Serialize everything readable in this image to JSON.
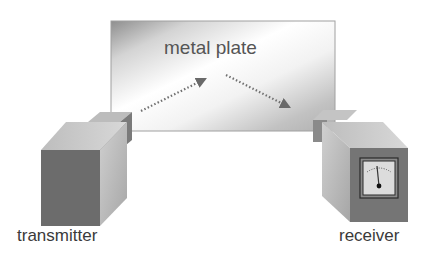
{
  "diagram": {
    "labels": {
      "plate": "metal plate",
      "transmitter": "transmitter",
      "receiver": "receiver"
    },
    "components": [
      {
        "id": "metal-plate",
        "label": "metal plate",
        "type": "reflector"
      },
      {
        "id": "transmitter",
        "label": "transmitter",
        "type": "source box"
      },
      {
        "id": "receiver",
        "label": "receiver",
        "type": "detector box with analog meter"
      }
    ],
    "arrows": [
      {
        "from": "transmitter",
        "to": "metal-plate",
        "style": "dotted"
      },
      {
        "from": "metal-plate",
        "to": "receiver",
        "style": "dotted"
      }
    ],
    "colors": {
      "plate_light": "#f4f4f4",
      "plate_dark": "#8c8c8c",
      "box_front_dark": "#6e6e6e",
      "box_side": "#a8a8a8",
      "box_top": "#c4c4c4",
      "arrow": "#666666",
      "text": "#3a3a3a"
    }
  }
}
